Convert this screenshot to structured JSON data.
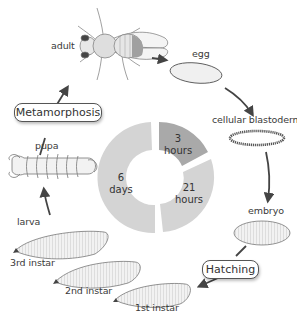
{
  "stages": {
    "adult": "adult",
    "egg": "egg",
    "cellular_blastoderm": "cellular blastoderm",
    "embryo": "embryo",
    "first_instar": "1st instar",
    "second_instar": "2nd instar",
    "third_instar": "3rd instar",
    "larva": "larva",
    "pupa": "pupa"
  },
  "events": {
    "metamorphosis": "Metamorphosis",
    "hatching": "Hatching"
  },
  "donut": {
    "segments": [
      {
        "value": "3",
        "unit": "hours",
        "color": "#a9a9a9"
      },
      {
        "value": "21",
        "unit": "hours",
        "color": "#d4d4d4"
      },
      {
        "value": "6",
        "unit": "days",
        "color": "#d4d4d4"
      }
    ]
  },
  "colors": {
    "arrow": "#444444",
    "outline": "#666666",
    "fill_light": "#ececec",
    "fill_dark": "#a9a9a9"
  }
}
